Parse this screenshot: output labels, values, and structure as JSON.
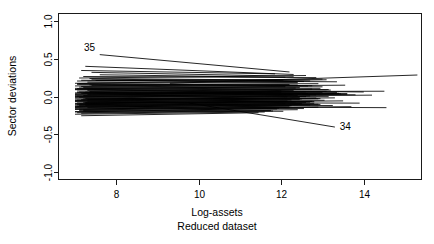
{
  "chart_data": {
    "type": "line",
    "title": "",
    "subtitle": "",
    "xlabel": "Log-assets",
    "xlabel_sub": "Reduced dataset",
    "ylabel": "Sector deviations",
    "xlim": [
      6.6,
      15.4
    ],
    "ylim": [
      -1.1,
      1.1
    ],
    "xticks": [
      8,
      10,
      12,
      14
    ],
    "xtick_labels": [
      "8",
      "10",
      "12",
      "14"
    ],
    "yticks": [
      1.0,
      0.5,
      0.0,
      -0.5,
      -1.0
    ],
    "ytick_labels": [
      "1.0",
      "0.5",
      "0.0",
      "-0.5",
      "-1.0"
    ],
    "grid": false,
    "legend": "none",
    "frame": true,
    "line_color": "#000000",
    "annotations": [
      {
        "text": "35",
        "x": 7.35,
        "y": 0.6
      },
      {
        "text": "34",
        "x": 13.55,
        "y": -0.44
      }
    ],
    "series": [
      {
        "name": "35",
        "x": [
          7.6,
          12.2
        ],
        "y": [
          0.555,
          0.325
        ]
      },
      {
        "name": "34",
        "x": [
          9.75,
          13.3
        ],
        "y": [
          -0.085,
          -0.405
        ]
      },
      {
        "name": "s1",
        "x": [
          7.15,
          11.85
        ],
        "y": [
          0.345,
          0.3
        ]
      },
      {
        "name": "s2",
        "x": [
          7.25,
          12.3
        ],
        "y": [
          0.4,
          0.292
        ]
      },
      {
        "name": "s3",
        "x": [
          7.1,
          12.6
        ],
        "y": [
          0.245,
          0.278
        ]
      },
      {
        "name": "s4",
        "x": [
          7.2,
          12.85
        ],
        "y": [
          0.265,
          0.25
        ]
      },
      {
        "name": "s5",
        "x": [
          7.05,
          13.0
        ],
        "y": [
          0.205,
          0.23
        ]
      },
      {
        "name": "s6",
        "x": [
          7.4,
          12.7
        ],
        "y": [
          0.23,
          0.205
        ]
      },
      {
        "name": "s7",
        "x": [
          7.0,
          13.1
        ],
        "y": [
          0.175,
          0.222
        ]
      },
      {
        "name": "s8",
        "x": [
          7.3,
          12.4
        ],
        "y": [
          0.19,
          0.185
        ]
      },
      {
        "name": "s9",
        "x": [
          7.05,
          12.9
        ],
        "y": [
          0.16,
          0.17
        ]
      },
      {
        "name": "s10",
        "x": [
          7.15,
          13.35
        ],
        "y": [
          0.215,
          0.195
        ]
      },
      {
        "name": "s11",
        "x": [
          7.0,
          12.2
        ],
        "y": [
          0.14,
          0.16
        ]
      },
      {
        "name": "s12",
        "x": [
          7.35,
          12.65
        ],
        "y": [
          0.155,
          0.14
        ]
      },
      {
        "name": "s13",
        "x": [
          7.1,
          13.55
        ],
        "y": [
          0.125,
          0.15
        ]
      },
      {
        "name": "s14",
        "x": [
          7.05,
          12.1
        ],
        "y": [
          0.105,
          0.13
        ]
      },
      {
        "name": "s15",
        "x": [
          7.2,
          12.95
        ],
        "y": [
          0.118,
          0.108
        ]
      },
      {
        "name": "s16",
        "x": [
          7.0,
          12.45
        ],
        "y": [
          0.09,
          0.118
        ]
      },
      {
        "name": "s17",
        "x": [
          7.3,
          13.2
        ],
        "y": [
          0.1,
          0.085
        ]
      },
      {
        "name": "s18",
        "x": [
          7.05,
          12.75
        ],
        "y": [
          0.072,
          0.098
        ]
      },
      {
        "name": "s19",
        "x": [
          7.1,
          14.5
        ],
        "y": [
          0.06,
          0.07
        ]
      },
      {
        "name": "s20",
        "x": [
          7.0,
          12.3
        ],
        "y": [
          0.048,
          0.082
        ]
      },
      {
        "name": "s21",
        "x": [
          7.25,
          13.0
        ],
        "y": [
          0.058,
          0.05
        ]
      },
      {
        "name": "s22",
        "x": [
          7.0,
          12.6
        ],
        "y": [
          0.03,
          0.062
        ]
      },
      {
        "name": "s23",
        "x": [
          7.15,
          13.45
        ],
        "y": [
          0.042,
          0.035
        ]
      },
      {
        "name": "s24",
        "x": [
          7.0,
          12.0
        ],
        "y": [
          0.018,
          0.048
        ]
      },
      {
        "name": "s25",
        "x": [
          7.3,
          12.85
        ],
        "y": [
          0.028,
          0.02
        ]
      },
      {
        "name": "s26",
        "x": [
          7.05,
          13.6
        ],
        "y": [
          0.005,
          0.03
        ]
      },
      {
        "name": "s27",
        "x": [
          7.0,
          12.4
        ],
        "y": [
          -0.008,
          0.015
        ]
      },
      {
        "name": "s28",
        "x": [
          7.2,
          13.15
        ],
        "y": [
          0.012,
          -0.002
        ]
      },
      {
        "name": "s29",
        "x": [
          7.0,
          12.7
        ],
        "y": [
          -0.02,
          0.008
        ]
      },
      {
        "name": "s30",
        "x": [
          7.1,
          14.2
        ],
        "y": [
          -0.01,
          0.018
        ]
      },
      {
        "name": "s31",
        "x": [
          7.0,
          12.15
        ],
        "y": [
          -0.035,
          -0.005
        ]
      },
      {
        "name": "s32",
        "x": [
          7.25,
          12.9
        ],
        "y": [
          -0.025,
          -0.03
        ]
      },
      {
        "name": "s33",
        "x": [
          7.05,
          13.3
        ],
        "y": [
          -0.048,
          -0.018
        ]
      },
      {
        "name": "s34",
        "x": [
          7.0,
          12.5
        ],
        "y": [
          -0.058,
          -0.032
        ]
      },
      {
        "name": "s35",
        "x": [
          7.15,
          13.05
        ],
        "y": [
          -0.042,
          -0.05
        ]
      },
      {
        "name": "s36",
        "x": [
          7.0,
          12.25
        ],
        "y": [
          -0.07,
          -0.045
        ]
      },
      {
        "name": "s37",
        "x": [
          7.3,
          12.8
        ],
        "y": [
          -0.062,
          -0.068
        ]
      },
      {
        "name": "s38",
        "x": [
          7.05,
          13.5
        ],
        "y": [
          -0.085,
          -0.058
        ]
      },
      {
        "name": "s39",
        "x": [
          7.0,
          12.35
        ],
        "y": [
          -0.095,
          -0.072
        ]
      },
      {
        "name": "s40",
        "x": [
          7.2,
          13.9
        ],
        "y": [
          -0.078,
          -0.088
        ]
      },
      {
        "name": "s41",
        "x": [
          7.0,
          12.6
        ],
        "y": [
          -0.11,
          -0.082
        ]
      },
      {
        "name": "s42",
        "x": [
          7.1,
          12.95
        ],
        "y": [
          -0.1,
          -0.105
        ]
      },
      {
        "name": "s43",
        "x": [
          7.0,
          12.1
        ],
        "y": [
          -0.125,
          -0.098
        ]
      },
      {
        "name": "s44",
        "x": [
          7.25,
          13.25
        ],
        "y": [
          -0.115,
          -0.12
        ]
      },
      {
        "name": "s45",
        "x": [
          7.0,
          12.7
        ],
        "y": [
          -0.14,
          -0.112
        ]
      },
      {
        "name": "s46",
        "x": [
          7.05,
          14.55
        ],
        "y": [
          -0.13,
          -0.148
        ]
      },
      {
        "name": "s47",
        "x": [
          7.0,
          12.2
        ],
        "y": [
          -0.155,
          -0.128
        ]
      },
      {
        "name": "s48",
        "x": [
          7.3,
          12.55
        ],
        "y": [
          -0.148,
          -0.16
        ]
      },
      {
        "name": "s49",
        "x": [
          7.0,
          12.9
        ],
        "y": [
          -0.172,
          -0.142
        ]
      },
      {
        "name": "s50",
        "x": [
          7.1,
          11.9
        ],
        "y": [
          -0.185,
          -0.165
        ]
      },
      {
        "name": "s51",
        "x": [
          7.0,
          12.4
        ],
        "y": [
          -0.2,
          -0.175
        ]
      },
      {
        "name": "s52",
        "x": [
          7.2,
          12.05
        ],
        "y": [
          -0.19,
          -0.196
        ]
      },
      {
        "name": "s53",
        "x": [
          7.05,
          11.75
        ],
        "y": [
          -0.215,
          -0.185
        ]
      },
      {
        "name": "s54",
        "x": [
          7.0,
          11.6
        ],
        "y": [
          -0.235,
          -0.205
        ]
      },
      {
        "name": "s55",
        "x": [
          7.15,
          11.45
        ],
        "y": [
          -0.255,
          -0.215
        ]
      },
      {
        "name": "s56",
        "x": [
          7.0,
          13.7
        ],
        "y": [
          -0.165,
          -0.135
        ]
      },
      {
        "name": "s57",
        "x": [
          7.4,
          12.3
        ],
        "y": [
          0.32,
          0.268
        ]
      },
      {
        "name": "s58",
        "x": [
          7.6,
          12.1
        ],
        "y": [
          0.288,
          0.255
        ]
      },
      {
        "name": "s59",
        "x": [
          7.0,
          14.0
        ],
        "y": [
          0.095,
          0.06
        ]
      },
      {
        "name": "s60",
        "x": [
          7.2,
          13.8
        ],
        "y": [
          0.048,
          0.022
        ]
      },
      {
        "name": "s61",
        "x": [
          7.5,
          12.55
        ],
        "y": [
          0.212,
          0.198
        ]
      },
      {
        "name": "s62",
        "x": [
          7.0,
          12.65
        ],
        "y": [
          -0.005,
          0.04
        ]
      },
      {
        "name": "s63",
        "x": [
          7.35,
          13.4
        ],
        "y": [
          0.065,
          0.042
        ]
      },
      {
        "name": "s64",
        "x": [
          7.0,
          12.45
        ],
        "y": [
          -0.052,
          -0.012
        ]
      },
      {
        "name": "s65",
        "x": [
          7.25,
          12.15
        ],
        "y": [
          -0.09,
          -0.06
        ]
      },
      {
        "name": "s66",
        "x": [
          7.1,
          12.8
        ],
        "y": [
          -0.118,
          -0.09
        ]
      },
      {
        "name": "s67",
        "x": [
          7.0,
          11.95
        ],
        "y": [
          -0.205,
          -0.155
        ]
      },
      {
        "name": "s68",
        "x": [
          7.15,
          12.35
        ],
        "y": [
          0.132,
          0.112
        ]
      },
      {
        "name": "s69",
        "x": [
          7.05,
          12.75
        ],
        "y": [
          0.172,
          0.142
        ]
      },
      {
        "name": "s70",
        "x": [
          7.3,
          13.1
        ],
        "y": [
          0.082,
          0.068
        ]
      },
      {
        "name": "s71",
        "x": [
          7.0,
          12.0
        ],
        "y": [
          0.035,
          0.072
        ]
      },
      {
        "name": "s72",
        "x": [
          7.2,
          12.6
        ],
        "y": [
          -0.032,
          -0.002
        ]
      },
      {
        "name": "s73",
        "x": [
          7.0,
          12.9
        ],
        "y": [
          -0.145,
          -0.102
        ]
      },
      {
        "name": "s74",
        "x": [
          7.1,
          12.25
        ],
        "y": [
          -0.168,
          -0.122
        ]
      },
      {
        "name": "s75",
        "x": [
          7.4,
          13.0
        ],
        "y": [
          0.148,
          0.128
        ]
      },
      {
        "name": "s76",
        "x": [
          7.0,
          13.35
        ],
        "y": [
          0.018,
          0.052
        ]
      },
      {
        "name": "s77",
        "x": [
          7.25,
          12.45
        ],
        "y": [
          -0.078,
          -0.042
        ]
      },
      {
        "name": "s78",
        "x": [
          7.05,
          12.7
        ],
        "y": [
          -0.108,
          -0.075
        ]
      },
      {
        "name": "s79",
        "x": [
          7.15,
          11.8
        ],
        "y": [
          -0.222,
          -0.192
        ]
      },
      {
        "name": "s80",
        "x": [
          7.0,
          13.15
        ],
        "y": [
          0.108,
          0.092
        ]
      },
      {
        "name": "s81",
        "x": [
          9.3,
          15.3
        ],
        "y": [
          0.175,
          0.285
        ]
      },
      {
        "name": "s82",
        "x": [
          7.0,
          12.3
        ],
        "y": [
          0.002,
          0.028
        ]
      },
      {
        "name": "s83",
        "x": [
          7.3,
          12.85
        ],
        "y": [
          -0.04,
          -0.02
        ]
      },
      {
        "name": "s84",
        "x": [
          7.0,
          12.5
        ],
        "y": [
          -0.132,
          -0.095
        ]
      },
      {
        "name": "s85",
        "x": [
          7.2,
          12.2
        ],
        "y": [
          -0.178,
          -0.148
        ]
      },
      {
        "name": "s86",
        "x": [
          7.05,
          13.6
        ],
        "y": [
          0.052,
          0.038
        ]
      },
      {
        "name": "s87",
        "x": [
          7.0,
          12.95
        ],
        "y": [
          -0.062,
          -0.028
        ]
      },
      {
        "name": "s88",
        "x": [
          7.35,
          12.05
        ],
        "y": [
          0.238,
          0.218
        ]
      },
      {
        "name": "s89",
        "x": [
          7.1,
          12.4
        ],
        "y": [
          0.168,
          0.152
        ]
      },
      {
        "name": "s90",
        "x": [
          7.0,
          12.75
        ],
        "y": [
          -0.098,
          -0.065
        ]
      }
    ]
  }
}
